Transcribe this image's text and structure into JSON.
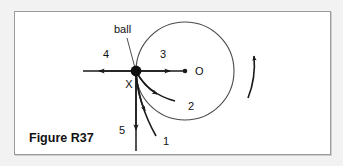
{
  "figure": {
    "caption": "Figure R37",
    "ball_label": "ball",
    "point_x_label": "X",
    "center_label": "O",
    "vectors": [
      {
        "id": "1",
        "label": "1",
        "description": "curved arrow down-right from ball"
      },
      {
        "id": "2",
        "label": "2",
        "description": "curved arrow right-down from ball, tangentially inward"
      },
      {
        "id": "3",
        "label": "3",
        "description": "straight arrow from ball toward center O"
      },
      {
        "id": "4",
        "label": "4",
        "description": "straight arrow from ball away from center O, to the left"
      },
      {
        "id": "5",
        "label": "5",
        "description": "straight arrow from ball vertically downward"
      }
    ],
    "rotation_indicator": {
      "label": "",
      "description": "curved arrow at right of circle pointing upward"
    },
    "colors": {
      "panel_background": "#ffffff",
      "page_background": "#f2f2f2",
      "panel_border": "#9a9a9a",
      "ink": "#1a1a1a",
      "circle": "#4a4a4a"
    }
  }
}
